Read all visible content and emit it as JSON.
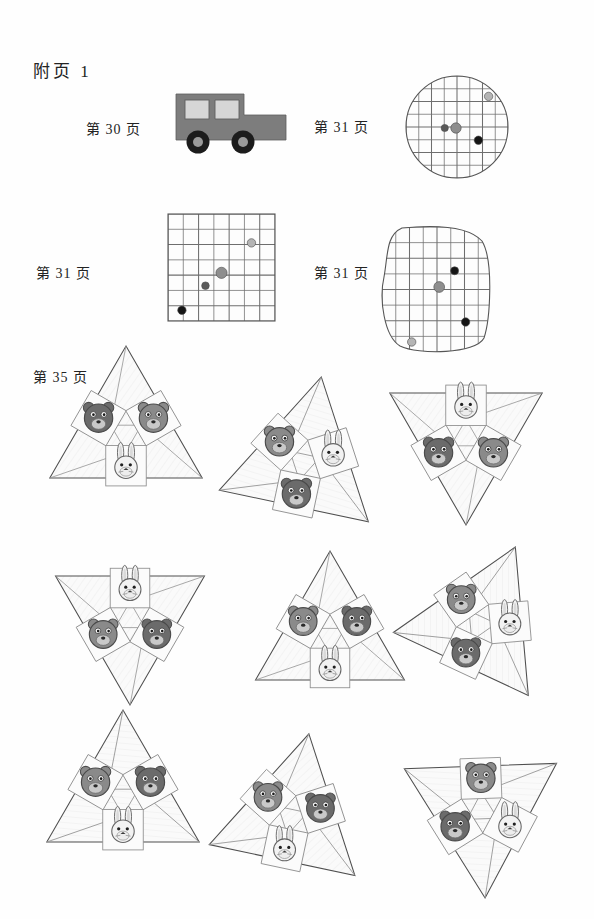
{
  "page": {
    "title": "附页 1",
    "background_color": "#fefefe",
    "width": 594,
    "height": 919
  },
  "labels": {
    "page_30": "第 30 页",
    "page_31_circle": "第 31 页",
    "page_31_square": "第 31 页",
    "page_31_blob": "第 31 页",
    "page_35": "第 35 页"
  },
  "colors": {
    "ink": "#232323",
    "grid_line": "#6e6e6e",
    "outline": "#555555",
    "car_body": "#7d7d7d",
    "car_window": "#d6d6d6",
    "car_tire": "#1c1c1c",
    "car_hub": "#9a9a9a",
    "dot_black": "#151515",
    "dot_dark_gray": "#5a5a5a",
    "dot_mid_gray": "#8e8e8e",
    "dot_light_gray": "#b4b4b4",
    "bear_dark": "#6b6b6b",
    "bear_mid": "#8a8a8a",
    "rabbit_white": "#f2f2f2",
    "cell_fill": "#fbfbfb",
    "triangle_fill": "#fafafa"
  },
  "figures": {
    "car": {
      "name": "jeep-cutout",
      "label_ref": "page_30",
      "x": 172,
      "y": 84,
      "width": 114,
      "height": 80
    },
    "circle_grid": {
      "name": "circle-grid-cutout",
      "label_ref": "page_31_circle",
      "cx": 457,
      "cy": 127,
      "r": 51,
      "grid_cells": 8,
      "dots": [
        {
          "id": "dot-light-topright",
          "x": 0.62,
          "y": -0.6,
          "r": 4.2,
          "color": "#b4b4b4"
        },
        {
          "id": "dot-dark-left",
          "x": -0.24,
          "y": 0.02,
          "r": 3.6,
          "color": "#5a5a5a"
        },
        {
          "id": "dot-mid-center",
          "x": -0.02,
          "y": 0.02,
          "r": 5.2,
          "color": "#8e8e8e"
        },
        {
          "id": "dot-black-right",
          "x": 0.42,
          "y": 0.26,
          "r": 4.2,
          "color": "#151515"
        }
      ]
    },
    "square_grid": {
      "name": "square-grid-cutout",
      "label_ref": "page_31_square",
      "x": 168,
      "y": 214,
      "size": 107,
      "grid_cells": 7,
      "dots": [
        {
          "id": "dot-light-upperright",
          "cx": 0.78,
          "cy": 0.27,
          "r": 4.2,
          "color": "#b4b4b4"
        },
        {
          "id": "dot-mid-center",
          "cx": 0.5,
          "cy": 0.55,
          "r": 5.6,
          "color": "#8e8e8e"
        },
        {
          "id": "dot-dark-lowerleft",
          "cx": 0.35,
          "cy": 0.67,
          "r": 3.8,
          "color": "#5a5a5a"
        },
        {
          "id": "dot-black-bottomleft",
          "cx": 0.13,
          "cy": 0.9,
          "r": 4.2,
          "color": "#151515"
        }
      ]
    },
    "blob_grid": {
      "name": "rounded-blob-grid-cutout",
      "label_ref": "page_31_blob",
      "x": 382,
      "y": 227,
      "width": 110,
      "height": 125,
      "grid_cells": 8,
      "dots": [
        {
          "id": "dot-black-upper",
          "cx": 0.66,
          "cy": 0.35,
          "r": 4.0,
          "color": "#151515"
        },
        {
          "id": "dot-mid-center",
          "cx": 0.52,
          "cy": 0.48,
          "r": 5.4,
          "color": "#8e8e8e"
        },
        {
          "id": "dot-black-lowerright",
          "cx": 0.76,
          "cy": 0.76,
          "r": 4.2,
          "color": "#151515"
        },
        {
          "id": "dot-light-bottomleft",
          "cx": 0.27,
          "cy": 0.92,
          "r": 4.2,
          "color": "#b4b4b4"
        }
      ]
    }
  },
  "triangles": [
    {
      "id": "triangle-1",
      "name": "triangle-piece-top-left",
      "cx": 126,
      "cy": 434,
      "size": 88,
      "rotation": 0,
      "cells": [
        {
          "position": "left",
          "animal": "bear",
          "shade": "dark"
        },
        {
          "position": "right",
          "animal": "bear",
          "shade": "mid"
        },
        {
          "position": "bottom",
          "animal": "rabbit",
          "shade": "white"
        }
      ]
    },
    {
      "id": "triangle-2",
      "name": "triangle-piece-top-center",
      "cx": 303,
      "cy": 463,
      "size": 88,
      "rotation": -108,
      "cells": [
        {
          "position": "left",
          "animal": "bear",
          "shade": "dark"
        },
        {
          "position": "right",
          "animal": "bear",
          "shade": "mid"
        },
        {
          "position": "bottom",
          "animal": "rabbit",
          "shade": "white"
        }
      ]
    },
    {
      "id": "triangle-3",
      "name": "triangle-piece-top-right",
      "cx": 466,
      "cy": 437,
      "size": 88,
      "rotation": 180,
      "cells": [
        {
          "position": "left",
          "animal": "bear",
          "shade": "mid"
        },
        {
          "position": "right",
          "animal": "bear",
          "shade": "dark"
        },
        {
          "position": "bottom",
          "animal": "rabbit",
          "shade": "white"
        }
      ]
    },
    {
      "id": "triangle-4",
      "name": "triangle-piece-mid-left",
      "cx": 130,
      "cy": 619,
      "size": 86,
      "rotation": 180,
      "cells": [
        {
          "position": "left",
          "animal": "bear",
          "shade": "dark"
        },
        {
          "position": "right",
          "animal": "bear",
          "shade": "mid"
        },
        {
          "position": "bottom",
          "animal": "rabbit",
          "shade": "white"
        }
      ]
    },
    {
      "id": "triangle-5",
      "name": "triangle-piece-mid-center",
      "cx": 330,
      "cy": 637,
      "size": 86,
      "rotation": 0,
      "cells": [
        {
          "position": "left",
          "animal": "bear",
          "shade": "mid"
        },
        {
          "position": "right",
          "animal": "bear",
          "shade": "dark"
        },
        {
          "position": "bottom",
          "animal": "rabbit",
          "shade": "white"
        }
      ]
    },
    {
      "id": "triangle-6",
      "name": "triangle-piece-mid-right",
      "cx": 479,
      "cy": 625,
      "size": 86,
      "rotation": 145,
      "cells": [
        {
          "position": "left",
          "animal": "rabbit",
          "shade": "white"
        },
        {
          "position": "right",
          "animal": "bear",
          "shade": "dark"
        },
        {
          "position": "bottom",
          "animal": "bear",
          "shade": "mid"
        }
      ]
    },
    {
      "id": "triangle-7",
      "name": "triangle-piece-bottom-left",
      "cx": 123,
      "cy": 798,
      "size": 88,
      "rotation": -120,
      "cells": [
        {
          "position": "left",
          "animal": "rabbit",
          "shade": "white"
        },
        {
          "position": "right",
          "animal": "bear",
          "shade": "mid"
        },
        {
          "position": "bottom",
          "animal": "bear",
          "shade": "dark"
        }
      ]
    },
    {
      "id": "triangle-8",
      "name": "triangle-piece-bottom-center",
      "cx": 291,
      "cy": 818,
      "size": 86,
      "rotation": 12,
      "cells": [
        {
          "position": "left",
          "animal": "bear",
          "shade": "mid"
        },
        {
          "position": "right",
          "animal": "bear",
          "shade": "dark"
        },
        {
          "position": "bottom",
          "animal": "rabbit",
          "shade": "white"
        }
      ]
    },
    {
      "id": "triangle-9",
      "name": "triangle-piece-bottom-right",
      "cx": 482,
      "cy": 810,
      "size": 88,
      "rotation": 58,
      "cells": [
        {
          "position": "left",
          "animal": "bear",
          "shade": "mid"
        },
        {
          "position": "right",
          "animal": "rabbit",
          "shade": "white"
        },
        {
          "position": "bottom",
          "animal": "bear",
          "shade": "dark"
        }
      ]
    }
  ]
}
